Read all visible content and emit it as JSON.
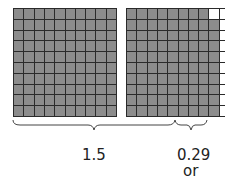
{
  "diagram": {
    "grids": [
      {
        "name": "grid-1",
        "rows": 10,
        "cols": 10,
        "shaded": 100
      },
      {
        "name": "grid-2",
        "rows": 10,
        "cols": 10,
        "shaded": 89,
        "full_shaded_columns": 8,
        "partial_column_shaded": 9
      }
    ],
    "labels": {
      "whole_plus_half": "1.5",
      "remainder": "0.29",
      "conjunction": "or"
    },
    "colors": {
      "shaded": "#8c8c8c",
      "grid_line": "#2a2a2a",
      "empty": "#ffffff"
    }
  }
}
